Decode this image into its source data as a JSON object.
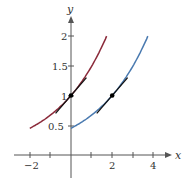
{
  "chart_data": {
    "type": "line",
    "title": "",
    "xlabel": "x",
    "ylabel": "y",
    "xlim": [
      -2.5,
      4.5
    ],
    "ylim": [
      -0.3,
      2.3
    ],
    "grid": false,
    "x_ticks": [
      -2,
      -1,
      1,
      2,
      3,
      4
    ],
    "x_tick_labels": [
      "−2",
      "2",
      "4"
    ],
    "y_ticks": [
      0.5,
      1,
      1.5,
      2
    ],
    "y_tick_labels": [
      "0.5",
      "1",
      "1.5",
      "2"
    ],
    "series": [
      {
        "name": "red-curve",
        "color": "#8b2a3a",
        "formula": "y = e^(0.4x)",
        "x_range": [
          -2,
          1.73
        ],
        "points": [
          [
            -2,
            0.45
          ],
          [
            -1,
            0.67
          ],
          [
            0,
            1
          ],
          [
            1,
            1.49
          ],
          [
            1.73,
            2
          ]
        ]
      },
      {
        "name": "blue-curve",
        "color": "#4a7ab0",
        "formula": "y = e^(0.4(x-2))",
        "x_range": [
          0,
          3.73
        ],
        "points": [
          [
            0,
            0.45
          ],
          [
            1,
            0.67
          ],
          [
            2,
            1
          ],
          [
            3,
            1.49
          ],
          [
            3.73,
            2
          ]
        ]
      }
    ],
    "tangent_lines": [
      {
        "point": [
          0,
          1
        ],
        "slope": 0.4,
        "x_range": [
          -0.75,
          0.75
        ],
        "color": "#111111"
      },
      {
        "point": [
          2,
          1
        ],
        "slope": 0.4,
        "x_range": [
          1.25,
          2.75
        ],
        "color": "#111111"
      }
    ],
    "points": [
      [
        0,
        1
      ],
      [
        2,
        1
      ]
    ]
  },
  "labels": {
    "x_axis": "x",
    "y_axis": "y",
    "xt_m2": "−2",
    "xt_2": "2",
    "xt_4": "4",
    "yt_05": "0.5",
    "yt_1": "1",
    "yt_15": "1.5",
    "yt_2": "2"
  }
}
